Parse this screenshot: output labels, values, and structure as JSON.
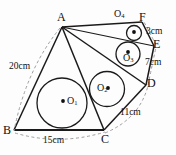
{
  "figure": {
    "background_color": "#fdfdfd",
    "stroke_color": "#1a1a1a",
    "dashed_color": "#9a9a9a"
  },
  "points": [
    {
      "id": "A",
      "label": "A",
      "x": 62,
      "y": 27
    },
    {
      "id": "B",
      "label": "B",
      "x": 14,
      "y": 130
    },
    {
      "id": "C",
      "label": "C",
      "x": 104,
      "y": 130
    },
    {
      "id": "D",
      "label": "D",
      "x": 146,
      "y": 85
    },
    {
      "id": "E",
      "label": "E",
      "x": 154,
      "y": 46
    },
    {
      "id": "F",
      "label": "F",
      "x": 142,
      "y": 22
    }
  ],
  "circles": [
    {
      "id": "O1",
      "label": "O",
      "subscript": "1",
      "cx": 62,
      "cy": 103,
      "r": 25,
      "dot_side": "left",
      "label_x": 67,
      "label_y": 99
    },
    {
      "id": "O2",
      "label": "O",
      "subscript": "2",
      "cx": 107,
      "cy": 89,
      "r": 17.5,
      "dot_side": "right",
      "label_x": 96,
      "label_y": 85
    },
    {
      "id": "O3",
      "label": "O",
      "subscript": "3",
      "cx": 128,
      "cy": 54,
      "r": 12,
      "dot_side": "above",
      "label_x": 122,
      "label_y": 58
    },
    {
      "id": "O4",
      "label": "O",
      "subscript": "4",
      "cx": 134,
      "cy": 33,
      "r": 7.5,
      "dot_side": "above",
      "label_x": 117,
      "label_y": 14
    }
  ],
  "dimensions": [
    {
      "id": "side-AB",
      "text": "20cm",
      "x": 11,
      "y": 66,
      "kind": "arc"
    },
    {
      "id": "side-BC",
      "text": "15cm",
      "x": 47,
      "y": 140,
      "kind": "arc"
    },
    {
      "id": "seg-CD",
      "text": "11cm",
      "x": 123,
      "y": 113,
      "kind": "arc"
    },
    {
      "id": "seg-DE",
      "text": "7cm",
      "x": 146,
      "y": 63,
      "kind": "arc"
    },
    {
      "id": "seg-EF",
      "text": "3cm",
      "x": 148,
      "y": 33,
      "kind": "arc"
    }
  ],
  "solid_edges": [
    {
      "id": "AB",
      "from": "A",
      "to": "B"
    },
    {
      "id": "BC",
      "from": "B",
      "to": "C"
    },
    {
      "id": "CD",
      "from": "C",
      "to": "D"
    },
    {
      "id": "DE",
      "from": "D",
      "to": "E"
    },
    {
      "id": "EF",
      "from": "E",
      "to": "F"
    },
    {
      "id": "FA",
      "from": "F",
      "to": "A"
    },
    {
      "id": "AC",
      "from": "A",
      "to": "C"
    },
    {
      "id": "AD",
      "from": "A",
      "to": "D"
    },
    {
      "id": "AE",
      "from": "A",
      "to": "E"
    }
  ]
}
